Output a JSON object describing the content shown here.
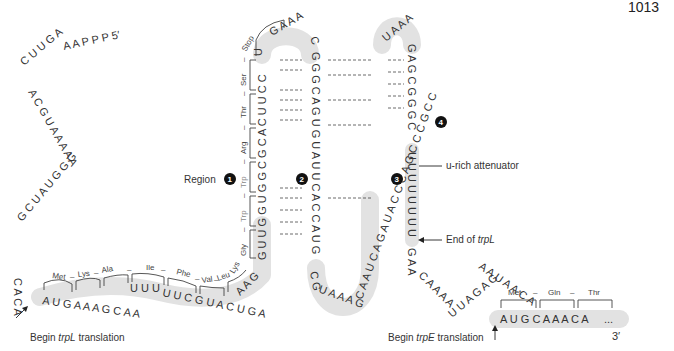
{
  "header": {
    "page_number": "1013",
    "running_title": "Attenuation of transcription"
  },
  "sequence": {
    "five_prime_label": "5′",
    "three_prime_label": "3′",
    "leader_5prime": "PPPAAGUUCACGUAAAAAGGGUAUCGACA",
    "trpL_coding": "AUGAAAGCAAUUUUCGUACUGAAAGGUUGGUGGCGCACUUCCUGA",
    "region2_down": "ACGGGACUUAUUGUGGACCAUG",
    "loop_2_3": "CGUAAAGCAAUCAGAUACCCAGCCCGCCUAAUGAG",
    "region4_down": "GAGCGGGC",
    "attenuator": "UUUUUUUU",
    "after_trpL": "GAACAAAAUUAGAGAAUAACA",
    "trpE_start": "AUGCAAACA",
    "trpE_ellipsis": "..."
  },
  "amino_acids": {
    "trpL": [
      "Met",
      "Lys",
      "Ala",
      "Ile",
      "Phe",
      "Val",
      "Leu",
      "Lys",
      "Gly",
      "Trp",
      "Trp",
      "Arg",
      "Thr",
      "Ser",
      "Stop"
    ],
    "trpE": [
      "Met",
      "Gln",
      "Thr"
    ],
    "separator": "–"
  },
  "regions": {
    "region_word": "Region",
    "badges": [
      "1",
      "2",
      "3",
      "4"
    ]
  },
  "annotations": {
    "begin_trpL": "Begin",
    "begin_trpL_gene": "trpL",
    "begin_trpL_suffix": "translation",
    "end_trpL": "End of",
    "end_trpL_gene": "trpL",
    "u_rich": "u-rich attenuator",
    "begin_trpE": "Begin",
    "begin_trpE_gene": "trpE",
    "begin_trpE_suffix": "translation"
  },
  "colors": {
    "shading": "#e2e2e2",
    "text": "#333333",
    "badge": "#111111",
    "trp_highlight": "#8a8a8a"
  }
}
